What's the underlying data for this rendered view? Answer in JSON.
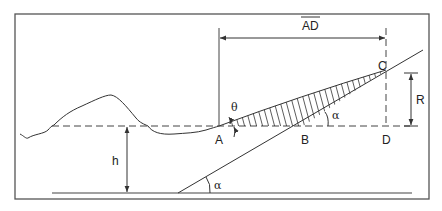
{
  "diagram": {
    "labels": {
      "A": "A",
      "B": "B",
      "C": "C",
      "D": "D",
      "R": "R",
      "h": "h",
      "theta": "θ",
      "alpha_top": "α",
      "alpha_bottom": "α",
      "AD": "AD"
    },
    "colors": {
      "line": "#333333",
      "frame": "#555555",
      "background": "#ffffff"
    }
  }
}
